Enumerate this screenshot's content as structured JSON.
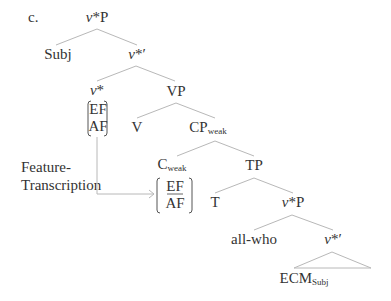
{
  "example_label": "c.",
  "nodes": {
    "root": {
      "head": "v",
      "rest": "*P"
    },
    "subj": "Subj",
    "vstar_bar": {
      "head": "v",
      "rest": "*′"
    },
    "vstar": {
      "head": "v",
      "rest": "*"
    },
    "vstar_features": [
      "EF",
      "AF"
    ],
    "vp": "VP",
    "v": "V",
    "cp": {
      "main": "CP",
      "sub": "weak"
    },
    "c": {
      "main": "C",
      "sub": "weak"
    },
    "c_features": [
      "EF",
      "AF"
    ],
    "tp": "TP",
    "t": "T",
    "vstar_p_lower": {
      "head": "v",
      "rest": "*P"
    },
    "all_who": "all-who",
    "vstar_bar_lower": {
      "head": "v",
      "rest": "*′"
    },
    "ecm": {
      "main": "ECM",
      "sub": "Subj"
    }
  },
  "annotation": {
    "line1": "Feature-",
    "line2": "Transcription"
  },
  "colors": {
    "text": "#333333",
    "edges": "#b8b8b8"
  }
}
